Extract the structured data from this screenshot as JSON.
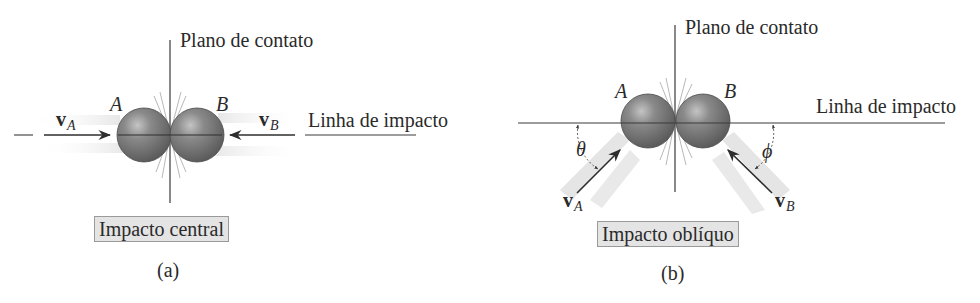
{
  "figure": {
    "panels": [
      {
        "id": "a",
        "sub_label": "(a)",
        "caption": "Impacto central",
        "contact_plane_label": "Plano de contato",
        "impact_line_label": "Linha de impacto",
        "body_a_label": "A",
        "body_b_label": "B",
        "velocity_a": {
          "symbol": "v",
          "subscript": "A"
        },
        "velocity_b": {
          "symbol": "v",
          "subscript": "B"
        }
      },
      {
        "id": "b",
        "sub_label": "(b)",
        "caption": "Impacto oblíquo",
        "contact_plane_label": "Plano de contato",
        "impact_line_label": "Linha de impacto",
        "body_a_label": "A",
        "body_b_label": "B",
        "velocity_a": {
          "symbol": "v",
          "subscript": "A"
        },
        "velocity_b": {
          "symbol": "v",
          "subscript": "B"
        },
        "angle_a": "θ",
        "angle_b": "ϕ"
      }
    ],
    "colors": {
      "line": "#3a3a3a",
      "sphere": "#6e6e6e",
      "sphere_highlight": "#b8b8b8",
      "caption_bg": "#e4e4e4",
      "motion_blur": "#d6d6d6"
    }
  }
}
